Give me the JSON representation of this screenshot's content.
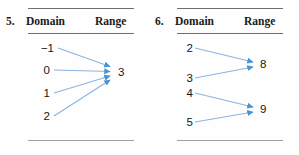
{
  "problems": [
    {
      "number": "5.",
      "headers": {
        "domain": "Domain",
        "range": "Range"
      },
      "domain_values": [
        "−1",
        "0",
        "1",
        "2"
      ],
      "range_values": [
        "3"
      ],
      "mappings": [
        {
          "from": "−1",
          "to": "3"
        },
        {
          "from": "0",
          "to": "3"
        },
        {
          "from": "1",
          "to": "3"
        },
        {
          "from": "2",
          "to": "3"
        }
      ]
    },
    {
      "number": "6.",
      "headers": {
        "domain": "Domain",
        "range": "Range"
      },
      "domain_values": [
        "2",
        "3",
        "4",
        "5"
      ],
      "range_values": [
        "8",
        "9"
      ],
      "mappings": [
        {
          "from": "2",
          "to": "8"
        },
        {
          "from": "3",
          "to": "8"
        },
        {
          "from": "4",
          "to": "9"
        },
        {
          "from": "5",
          "to": "9"
        }
      ]
    }
  ],
  "style": {
    "arrow_color": "#5b9bd5",
    "rule_color": "#6e6e6e",
    "text_color": "#161616"
  }
}
